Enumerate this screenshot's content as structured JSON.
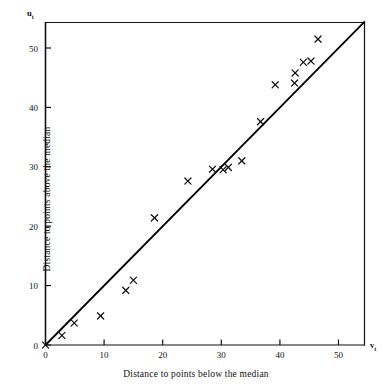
{
  "chart_data": {
    "type": "scatter",
    "title": "",
    "xlabel": "Distance to points below the median",
    "ylabel": "Distance to points above the median",
    "x_var_symbol": "v",
    "x_var_subscript": "t",
    "y_var_symbol": "u",
    "y_var_subscript": "t",
    "xlim": [
      0,
      54.5
    ],
    "ylim": [
      0,
      54.5
    ],
    "xticks": [
      0,
      10,
      20,
      30,
      40,
      50
    ],
    "yticks": [
      0,
      10,
      20,
      30,
      40,
      50
    ],
    "xtick_labels": [
      "0",
      "10",
      "20",
      "30",
      "40",
      "50"
    ],
    "ytick_labels": [
      "0",
      "10",
      "20",
      "30",
      "40",
      "50"
    ],
    "grid": false,
    "legend": null,
    "marker": "x",
    "marker_color": "#111111",
    "line_color": "#000000",
    "reference_line": {
      "name": "45-degree line",
      "slope": 1,
      "intercept": 0,
      "x_from": 0,
      "x_to": 54.5
    },
    "points": [
      {
        "x": 0.0,
        "y": 0.0
      },
      {
        "x": 2.8,
        "y": 1.6
      },
      {
        "x": 4.9,
        "y": 3.7
      },
      {
        "x": 9.4,
        "y": 4.9
      },
      {
        "x": 13.7,
        "y": 9.2
      },
      {
        "x": 15.0,
        "y": 10.9
      },
      {
        "x": 18.6,
        "y": 21.4
      },
      {
        "x": 24.3,
        "y": 27.6
      },
      {
        "x": 28.5,
        "y": 29.6
      },
      {
        "x": 30.3,
        "y": 29.5
      },
      {
        "x": 31.2,
        "y": 29.9
      },
      {
        "x": 33.5,
        "y": 31.0
      },
      {
        "x": 36.7,
        "y": 37.6
      },
      {
        "x": 39.2,
        "y": 43.8
      },
      {
        "x": 42.5,
        "y": 44.1
      },
      {
        "x": 42.6,
        "y": 45.8
      },
      {
        "x": 44.0,
        "y": 47.6
      },
      {
        "x": 45.3,
        "y": 47.8
      },
      {
        "x": 46.5,
        "y": 51.5
      }
    ]
  }
}
